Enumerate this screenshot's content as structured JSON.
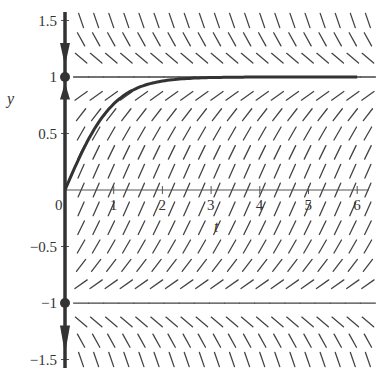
{
  "chart_data": {
    "type": "line",
    "title": "",
    "subtitle": "Direction field with phase line for dy/dt = 1 - y^2",
    "xlabel": "t",
    "ylabel": "y",
    "xlim": [
      0,
      6.2
    ],
    "ylim": [
      -1.6,
      1.6
    ],
    "grid": false,
    "legend": null,
    "x_ticks": [
      {
        "value": 0,
        "label": "0"
      },
      {
        "value": 1,
        "label": "1"
      },
      {
        "value": 2,
        "label": "2"
      },
      {
        "value": 3,
        "label": "3"
      },
      {
        "value": 4,
        "label": "4"
      },
      {
        "value": 5,
        "label": "5"
      },
      {
        "value": 6,
        "label": "6"
      }
    ],
    "y_ticks": [
      {
        "value": 1.5,
        "label": "1.5"
      },
      {
        "value": 1,
        "label": "1"
      },
      {
        "value": 0.5,
        "label": "0.5"
      },
      {
        "value": -0.5,
        "label": "-0.5"
      },
      {
        "value": -1,
        "label": "-1"
      },
      {
        "value": -1.5,
        "label": "-1.5"
      }
    ],
    "slope_field": {
      "equation": "dy/dt = 1 - y^2",
      "t_start": 0.33,
      "t_step": 0.31,
      "t_count": 20,
      "y_start": 1.5,
      "y_step": -0.1667,
      "y_count": 19
    },
    "series": [
      {
        "name": "solution y(0)=0",
        "x": [
          0,
          0.25,
          0.5,
          0.75,
          1,
          1.25,
          1.5,
          1.75,
          2,
          2.5,
          3,
          3.5,
          4,
          5,
          6
        ],
        "y": [
          0,
          0.245,
          0.462,
          0.635,
          0.762,
          0.848,
          0.905,
          0.941,
          0.964,
          0.987,
          0.995,
          0.998,
          0.999,
          1.0,
          1.0
        ]
      }
    ],
    "equilibria": [
      {
        "y": 1,
        "type": "stable"
      },
      {
        "y": -1,
        "type": "unstable"
      }
    ],
    "phase_line_arrows": [
      {
        "y_from": 1.3,
        "y_to": 1.1,
        "direction": "down"
      },
      {
        "y_from": 0.8,
        "y_to": 0.95,
        "direction": "up"
      },
      {
        "y_from": -1.2,
        "y_to": -1.45,
        "direction": "down"
      }
    ]
  }
}
